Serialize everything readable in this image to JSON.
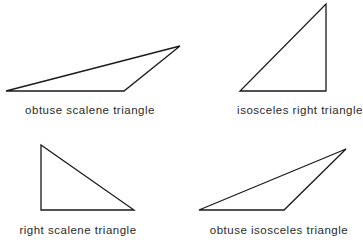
{
  "figures": [
    {
      "id": "obtuse-scalene",
      "label": "obtuse scalene triangle",
      "points": "6,91 124,91 180,46",
      "label_x": 90,
      "label_y": 104
    },
    {
      "id": "isosceles-right",
      "label": "isosceles right triangle",
      "points": "240,91 326,91 326,4",
      "label_x": 300,
      "label_y": 104
    },
    {
      "id": "right-scalene",
      "label": "right scalene triangle",
      "points": "41,145 41,210 134,210",
      "label_x": 78,
      "label_y": 224
    },
    {
      "id": "obtuse-isosceles",
      "label": "obtuse isosceles triangle",
      "points": "199,210 284,210 346,149",
      "label_x": 279,
      "label_y": 224
    }
  ],
  "style": {
    "stroke_color": "#1a1a1a",
    "text_color": "#2a2a2a",
    "background": "#ffffff"
  }
}
